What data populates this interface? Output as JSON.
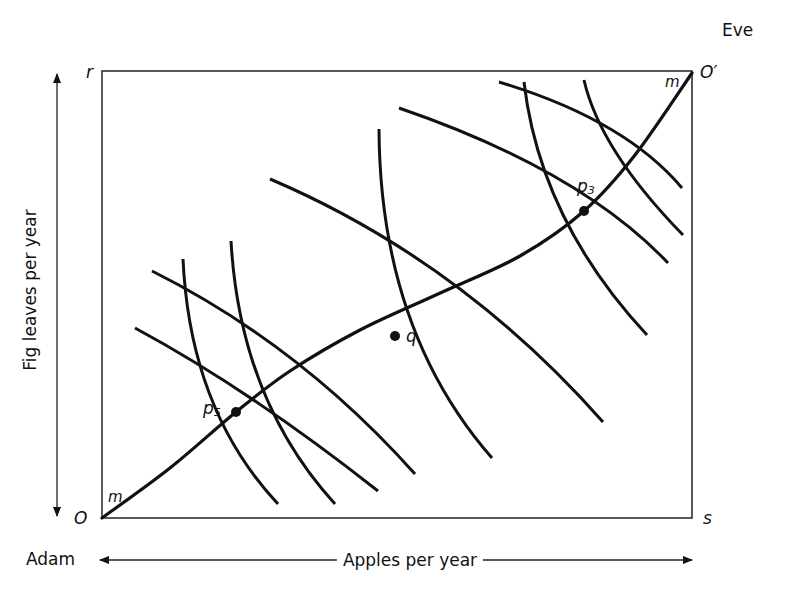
{
  "diagram": {
    "type": "edgeworth-box",
    "box": {
      "x0": 102,
      "y0": 71,
      "x1": 692,
      "y1": 518
    },
    "corner_labels": {
      "top_left": "r",
      "top_right": "O′",
      "bottom_left": "O",
      "bottom_right": "s"
    },
    "agents": {
      "origin_agent": "Adam",
      "opposite_agent": "Eve"
    },
    "axes": {
      "x_label": "Apples per year",
      "y_label": "Fig leaves per year"
    },
    "contract_curve": {
      "label": "m",
      "label_top": "m",
      "label_bottom": "m",
      "points": [
        [
          102,
          518
        ],
        [
          170,
          468
        ],
        [
          236,
          412
        ],
        [
          290,
          371
        ],
        [
          360,
          330
        ],
        [
          438,
          294
        ],
        [
          520,
          256
        ],
        [
          584,
          211
        ],
        [
          635,
          155
        ],
        [
          692,
          73
        ]
      ]
    },
    "points": [
      {
        "id": "p5",
        "label_main": "p",
        "label_sub": "5",
        "x": 236,
        "y": 412
      },
      {
        "id": "p3",
        "label_main": "p",
        "label_sub": "3",
        "x": 584,
        "y": 211
      },
      {
        "id": "q",
        "label": "q",
        "x": 395,
        "y": 336
      }
    ],
    "adam_indifference_curves": [
      {
        "id": "A1",
        "d": "M135,328 Q250,390 378,491"
      },
      {
        "id": "A2",
        "d": "M152,271 Q300,345 415,474"
      },
      {
        "id": "A3",
        "d": "M270,179 Q460,260 603,422"
      },
      {
        "id": "A4",
        "d": "M399,108 Q580,170 668,263"
      },
      {
        "id": "A5",
        "d": "M499,82 Q625,120 682,188"
      }
    ],
    "eve_indifference_curves": [
      {
        "id": "E1",
        "d": "M183,259 Q190,410 278,504"
      },
      {
        "id": "E2",
        "d": "M231,241 Q240,400 335,504"
      },
      {
        "id": "E3",
        "d": "M379,129 Q380,330 492,458"
      },
      {
        "id": "E4",
        "d": "M524,82 Q540,220 647,335"
      },
      {
        "id": "E5",
        "d": "M584,80 Q600,150 683,235"
      }
    ],
    "colors": {
      "ink": "#111111",
      "background": "#ffffff"
    }
  }
}
